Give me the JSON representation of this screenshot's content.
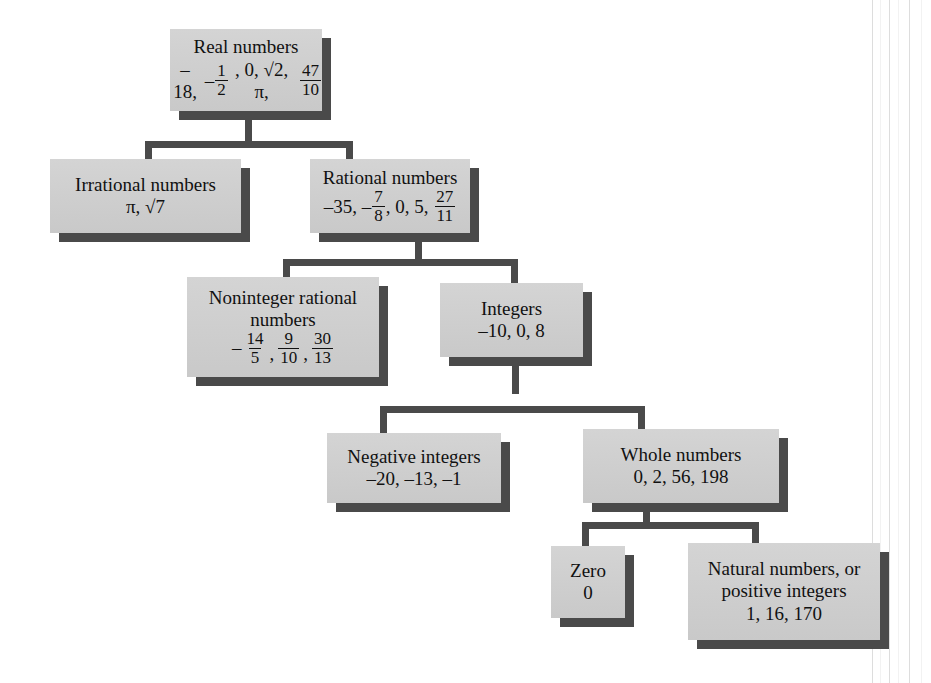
{
  "diagram": {
    "type": "hierarchy-tree",
    "box_fill": "#cfcfcf",
    "shadow_color": "#4a4a4a",
    "connector_color": "#4a4a4a",
    "nodes": {
      "real": {
        "label": "Real numbers",
        "values_plain": "–18, –1/2, 0, √2, π, 47/10",
        "v1": "–18,",
        "v2_sign": "–",
        "v2_num": "1",
        "v2_den": "2",
        "v3": ", 0, √2, π,",
        "v4_num": "47",
        "v4_den": "10"
      },
      "irrational": {
        "label": "Irrational numbers",
        "values_plain": "π, √7"
      },
      "rational": {
        "label": "Rational numbers",
        "values_plain": "–35, –7/8, 0, 5, 27/11",
        "v1": "–35,",
        "v2_sign": "–",
        "v2_num": "7",
        "v2_den": "8",
        "v3": ", 0, 5,",
        "v4_num": "27",
        "v4_den": "11"
      },
      "noninteger": {
        "label_line1": "Noninteger rational",
        "label_line2": "numbers",
        "values_plain": "–14/5, 9/10, 30/13",
        "lead_sign": "–",
        "f1_num": "14",
        "f1_den": "5",
        "sep1": ",",
        "f2_num": "9",
        "f2_den": "10",
        "sep2": ",",
        "f3_num": "30",
        "f3_den": "13"
      },
      "integers": {
        "label": "Integers",
        "values_plain": "–10, 0, 8"
      },
      "negative_integers": {
        "label": "Negative integers",
        "values_plain": "–20, –13, –1"
      },
      "whole": {
        "label": "Whole numbers",
        "values_plain": "0, 2, 56, 198"
      },
      "zero": {
        "label": "Zero",
        "values_plain": "0"
      },
      "natural": {
        "label_line1": "Natural numbers, or",
        "label_line2": "positive integers",
        "values_plain": "1, 16, 170"
      }
    },
    "edges": [
      {
        "from": "real",
        "to": "irrational"
      },
      {
        "from": "real",
        "to": "rational"
      },
      {
        "from": "rational",
        "to": "noninteger"
      },
      {
        "from": "rational",
        "to": "integers"
      },
      {
        "from": "integers",
        "to": "negative_integers"
      },
      {
        "from": "integers",
        "to": "whole"
      },
      {
        "from": "whole",
        "to": "zero"
      },
      {
        "from": "whole",
        "to": "natural"
      }
    ]
  }
}
